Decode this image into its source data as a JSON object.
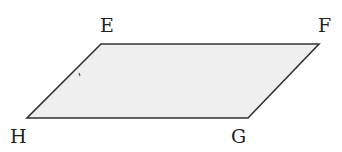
{
  "diagram": {
    "type": "parallelogram",
    "fill_color": "#efefef",
    "stroke_color": "#333333",
    "vertices": [
      {
        "label": "E",
        "x": 101,
        "y": 44,
        "label_x": 100,
        "label_y": 32
      },
      {
        "label": "F",
        "x": 319,
        "y": 44,
        "label_x": 318,
        "label_y": 32
      },
      {
        "label": "G",
        "x": 248,
        "y": 118,
        "label_x": 231,
        "label_y": 143
      },
      {
        "label": "H",
        "x": 27,
        "y": 118,
        "label_x": 10,
        "label_y": 143
      }
    ]
  }
}
